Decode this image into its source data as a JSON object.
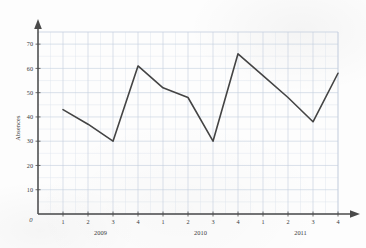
{
  "chart_data": {
    "type": "line",
    "title": "",
    "xlabel": "",
    "ylabel": "Absences",
    "origin_label": "0",
    "ylim": [
      0,
      75
    ],
    "yticks": [
      10,
      20,
      30,
      40,
      50,
      60,
      70
    ],
    "ytick_labels": [
      "10",
      "20",
      "30",
      "40",
      "50",
      "60",
      "70"
    ],
    "grid": true,
    "grid_minor": true,
    "legend": "none",
    "categories": [
      "2009 Q1",
      "2009 Q2",
      "2009 Q3",
      "2009 Q4",
      "2010 Q1",
      "2010 Q2",
      "2010 Q3",
      "2010 Q4",
      "2011 Q1",
      "2011 Q2",
      "2011 Q3",
      "2011 Q4"
    ],
    "xtick_labels": [
      "1",
      "2",
      "3",
      "4",
      "1",
      "2",
      "3",
      "4",
      "1",
      "2",
      "3",
      "4"
    ],
    "group_labels": [
      {
        "text": "2009",
        "center_index": 1.5
      },
      {
        "text": "2010",
        "center_index": 5.5
      },
      {
        "text": "2011",
        "center_index": 9.5
      }
    ],
    "series": [
      {
        "name": "Absences",
        "color": "#444444",
        "values": [
          43,
          37,
          30,
          61,
          52,
          48,
          30,
          66,
          57,
          48,
          38,
          58
        ]
      }
    ]
  },
  "colors": {
    "line": "#444444",
    "axis": "#4a4a4a",
    "grid_major": "#c2cedd",
    "grid_minor": "#dde5ee",
    "text": "#3a3a3a",
    "paper": "#fdfdfd"
  }
}
